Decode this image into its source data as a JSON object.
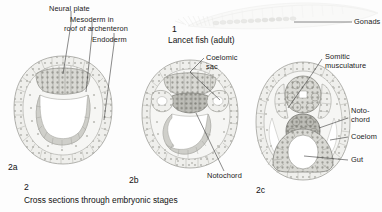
{
  "figure": {
    "caption_number": "2",
    "caption_text": "Cross sections through embryonic stages"
  },
  "adult": {
    "number": "1",
    "label": "Lancet fish (adult)",
    "callouts": [
      {
        "name": "gonads",
        "text": "Gonads"
      }
    ]
  },
  "stages": [
    {
      "id": "2a",
      "label": "2a",
      "callouts": [
        {
          "name": "neural-plate",
          "text": "Neural plate"
        },
        {
          "name": "mesoderm-roof-archenteron",
          "line1": "Mesoderm in",
          "line2": "roof of archenteron"
        },
        {
          "name": "endoderm",
          "text": "Endoderm"
        }
      ]
    },
    {
      "id": "2b",
      "label": "2b",
      "callouts": [
        {
          "name": "coelomic-sac",
          "line1": "Coelomic",
          "line2": "sac"
        },
        {
          "name": "notochord",
          "text": "Notochord"
        }
      ]
    },
    {
      "id": "2c",
      "label": "2c",
      "callouts": [
        {
          "name": "somitic-musculature",
          "line1": "Somitic",
          "line2": "musculature"
        },
        {
          "name": "notochord",
          "line1": "Noto-",
          "line2": "chord"
        },
        {
          "name": "coelom",
          "text": "Coelom"
        },
        {
          "name": "gut",
          "text": "Gut"
        }
      ]
    }
  ],
  "colors": {
    "background": "#fdfdfd",
    "ink": "#1b1b1b",
    "leader": "#2a2a2a",
    "tissue_light": "#e9e9e6",
    "tissue_mid": "#cfcfcb",
    "tissue_dark": "#a8a8a4",
    "cavity": "#ffffff",
    "faint": "#f0f0ee"
  }
}
